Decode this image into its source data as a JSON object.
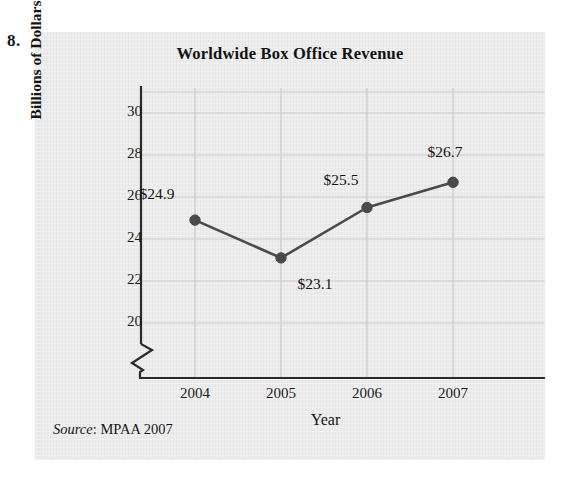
{
  "exercise": {
    "number": "8."
  },
  "chart_data": {
    "type": "line",
    "title": "Worldwide Box Office Revenue",
    "xlabel": "Year",
    "ylabel": "Billions of Dollars",
    "categories": [
      "2004",
      "2005",
      "2006",
      "2007"
    ],
    "values": [
      24.9,
      23.1,
      25.5,
      26.7
    ],
    "point_labels": [
      "$24.9",
      "$23.1",
      "$25.5",
      "$26.7"
    ],
    "ylim": [
      19,
      31
    ],
    "yticks": [
      20,
      22,
      24,
      26,
      28,
      30
    ],
    "ytick_labels": [
      "20",
      "22",
      "24",
      "26",
      "28",
      "30"
    ],
    "grid": "horizontal-and-vertical-faint",
    "legend": "none",
    "axis_break": true,
    "marker": "filled-circle",
    "series_color": "#4a4a4a",
    "gridline_color": "#d7d7d8",
    "axis_color": "#2a2a2a",
    "background_color": "#ececed",
    "label_offsets": [
      {
        "label": "$24.9",
        "dx": -38,
        "dy": -26
      },
      {
        "label": "$23.1",
        "dx": 34,
        "dy": 26
      },
      {
        "label": "$25.5",
        "dx": -26,
        "dy": -28
      },
      {
        "label": "$26.7",
        "dx": -8,
        "dy": -30
      }
    ]
  },
  "source": {
    "word": "Source",
    "rest": ": MPAA 2007"
  }
}
